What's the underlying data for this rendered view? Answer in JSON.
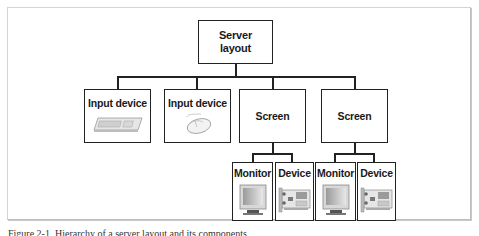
{
  "diagram": {
    "root": {
      "label_line1": "Server",
      "label_line2": "layout"
    },
    "level2": [
      {
        "label": "Input device",
        "icon": "keyboard-icon"
      },
      {
        "label": "Input device",
        "icon": "mouse-icon"
      },
      {
        "label": "Screen"
      },
      {
        "label": "Screen"
      }
    ],
    "level3": [
      {
        "label": "Monitor",
        "icon": "monitor-icon",
        "parent": 2
      },
      {
        "label": "Device",
        "icon": "graphics-card-icon",
        "parent": 2
      },
      {
        "label": "Monitor",
        "icon": "monitor-icon",
        "parent": 3
      },
      {
        "label": "Device",
        "icon": "graphics-card-icon",
        "parent": 3
      }
    ],
    "colors": {
      "line": "#222222",
      "frame": "#bdbdbd",
      "background": "#ffffff"
    }
  },
  "caption": "Figure 2-1. Hierarchy of a server layout and its components"
}
